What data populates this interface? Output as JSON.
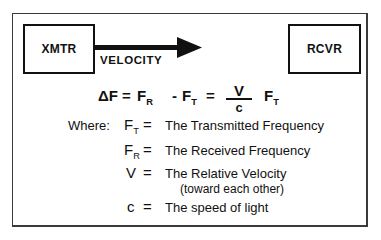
{
  "diagram": {
    "transmitter_label": "XMTR",
    "receiver_label": "RCVR",
    "arrow_label": "VELOCITY",
    "colors": {
      "ink": "#111111",
      "frame": "#3a3a3a",
      "background": "#ffffff"
    }
  },
  "equation": {
    "lhs": "ΔF",
    "eq1": "=",
    "term1_base": "F",
    "term1_sub": "R",
    "minus": "-",
    "term2_base": "F",
    "term2_sub": "T",
    "eq2": "=",
    "frac_num": "V",
    "frac_den": "c",
    "term3_base": "F",
    "term3_sub": "T"
  },
  "definitions": {
    "where_label": "Where:",
    "items": [
      {
        "sym_base": "F",
        "sym_sub": "T",
        "eq": "=",
        "text": "The Transmitted Frequency"
      },
      {
        "sym_base": "F",
        "sym_sub": "R",
        "eq": "=",
        "text": "The Received Frequency"
      },
      {
        "sym_base": "V",
        "sym_sub": "",
        "eq": "=",
        "text": "The Relative Velocity",
        "text2": "(toward each other)"
      },
      {
        "sym_base": "c",
        "sym_sub": "",
        "eq": "=",
        "text": "The speed of light"
      }
    ]
  }
}
